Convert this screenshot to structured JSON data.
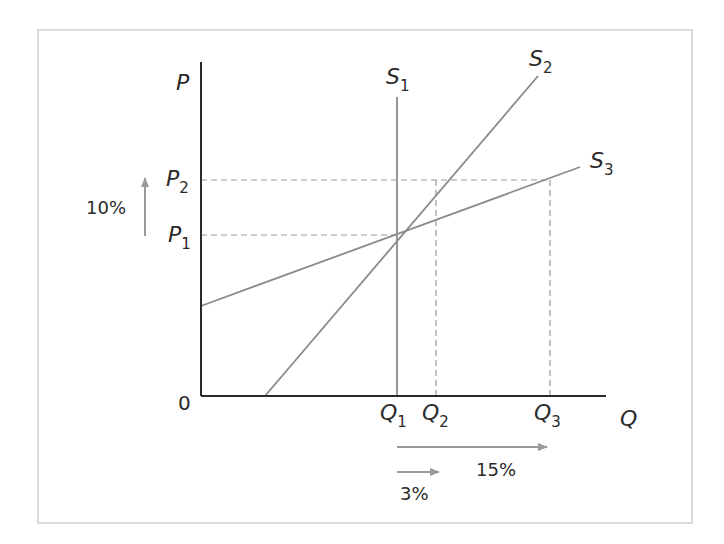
{
  "diagram": {
    "type": "supply-elasticity",
    "axes": {
      "y_label": "P",
      "x_label": "Q",
      "origin_label": "0"
    },
    "price_levels": [
      {
        "label": "P",
        "sub": "1"
      },
      {
        "label": "P",
        "sub": "2"
      }
    ],
    "quantity_levels": [
      {
        "label": "Q",
        "sub": "1"
      },
      {
        "label": "Q",
        "sub": "2"
      },
      {
        "label": "Q",
        "sub": "3"
      }
    ],
    "curves": [
      {
        "label": "S",
        "sub": "1",
        "description": "perfectly inelastic (vertical)"
      },
      {
        "label": "S",
        "sub": "2",
        "description": "relatively inelastic"
      },
      {
        "label": "S",
        "sub": "3",
        "description": "relatively elastic"
      }
    ],
    "annotations": {
      "price_change": "10%",
      "qty_change_s2": "3%",
      "qty_change_s3": "15%"
    },
    "colors": {
      "axis": "#2a2a2a",
      "curve": "#8a8a8a",
      "dash": "#9a9a9a",
      "arrow": "#9a9a9a",
      "frame": "#cfcfcf"
    }
  }
}
